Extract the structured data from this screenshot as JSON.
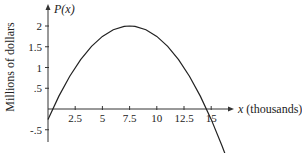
{
  "chart_data": {
    "type": "line",
    "title": "",
    "function_label": "P(x)",
    "xlabel": "x (thousands)",
    "ylabel": "Millions of dollars",
    "x_ticks": [
      2.5,
      5,
      7.5,
      10,
      12.5,
      15
    ],
    "x_tick_labels": [
      "2.5",
      "5",
      "7.5",
      "10",
      "12.5",
      "15"
    ],
    "y_ticks": [
      -0.5,
      0.5,
      1,
      1.5,
      2
    ],
    "y_tick_labels": [
      "-.5",
      ".5",
      "1",
      "1.5",
      "2"
    ],
    "xlim": [
      0,
      17
    ],
    "ylim": [
      -0.8,
      2.4
    ],
    "grid": false,
    "legend": null,
    "series": [
      {
        "name": "P(x)",
        "x": [
          0,
          1,
          2,
          3,
          4,
          5,
          6,
          7,
          7.5,
          8,
          9,
          10,
          11,
          12,
          13,
          14,
          15,
          16,
          16.5
        ],
        "values": [
          -0.25,
          0.31,
          0.79,
          1.19,
          1.51,
          1.75,
          1.91,
          1.99,
          2.0,
          1.99,
          1.91,
          1.75,
          1.51,
          1.19,
          0.79,
          0.31,
          -0.25,
          -0.89,
          -1.24
        ]
      }
    ],
    "annotations": [
      "P(x)",
      "x (thousands)"
    ]
  },
  "labels": {
    "function_label": "P(x)",
    "x_axis_title": "x (thousands)",
    "y_axis_title": "Millions of dollars"
  }
}
